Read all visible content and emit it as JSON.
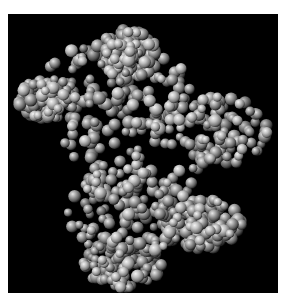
{
  "image": {
    "subject": "space-filling molecular model of a protein",
    "background_color": "#000000",
    "border_color": "#ffffff",
    "atom_color": "#9a9a9a",
    "highlight_color": "#e6e6e6"
  },
  "model": {
    "seed": 7,
    "atom_count": 900,
    "blobs": [
      {
        "cx": 105,
        "cy": 75,
        "rx": 80,
        "ry": 45
      },
      {
        "cx": 120,
        "cy": 40,
        "rx": 30,
        "ry": 25
      },
      {
        "cx": 140,
        "cy": 130,
        "rx": 85,
        "ry": 70
      },
      {
        "cx": 215,
        "cy": 115,
        "rx": 45,
        "ry": 35
      },
      {
        "cx": 120,
        "cy": 200,
        "rx": 60,
        "ry": 45
      },
      {
        "cx": 195,
        "cy": 210,
        "rx": 40,
        "ry": 25
      },
      {
        "cx": 115,
        "cy": 250,
        "rx": 40,
        "ry": 25
      },
      {
        "cx": 40,
        "cy": 85,
        "rx": 30,
        "ry": 20
      }
    ]
  }
}
